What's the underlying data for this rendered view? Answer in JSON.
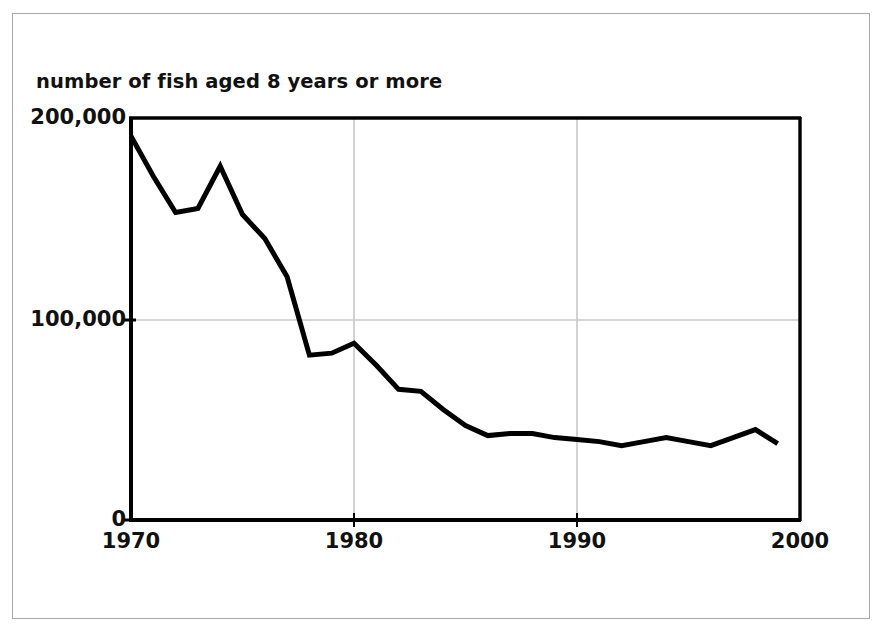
{
  "chart_data": {
    "type": "line",
    "title": "number of fish aged 8 years or more",
    "xlabel": "",
    "ylabel": "number of fish aged 8 years or more",
    "xlim": [
      1970,
      2000
    ],
    "ylim": [
      0,
      200000
    ],
    "xticks": [
      "1970",
      "1980",
      "1990",
      "2000"
    ],
    "xtick_values": [
      1970,
      1980,
      1990,
      2000
    ],
    "yticks": [
      "0",
      "100,000",
      "200,000"
    ],
    "ytick_values": [
      0,
      100000,
      200000
    ],
    "grid": "light gray gridlines at x=1980, x=1990 and y=100,000",
    "legend": "none",
    "line_color": "#000000",
    "line_width": 4,
    "x": [
      1970,
      1971,
      1972,
      1973,
      1974,
      1975,
      1976,
      1977,
      1978,
      1979,
      1980,
      1981,
      1982,
      1983,
      1984,
      1985,
      1986,
      1987,
      1988,
      1989,
      1990,
      1991,
      1992,
      1993,
      1994,
      1995,
      1996,
      1997,
      1998,
      1999
    ],
    "values": [
      191000,
      171000,
      153000,
      155000,
      176000,
      152000,
      140000,
      121000,
      82000,
      83000,
      88000,
      77000,
      65000,
      64000,
      55000,
      47000,
      42000,
      43000,
      43000,
      41000,
      40000,
      39000,
      37000,
      39000,
      41000,
      39000,
      37000,
      41000,
      45000,
      38000
    ],
    "series": [
      {
        "name": "number of fish aged 8 years or more",
        "values": [
          191000,
          171000,
          153000,
          155000,
          176000,
          152000,
          140000,
          121000,
          82000,
          83000,
          88000,
          77000,
          65000,
          64000,
          55000,
          47000,
          42000,
          43000,
          43000,
          41000,
          40000,
          39000,
          37000,
          39000,
          41000,
          39000,
          37000,
          41000,
          45000,
          38000
        ]
      }
    ]
  },
  "figure": {
    "background_color": "#ffffff",
    "border_color": "#a9a9ac",
    "axis_color": "#000000",
    "grid_color": "#c9c9c9"
  }
}
